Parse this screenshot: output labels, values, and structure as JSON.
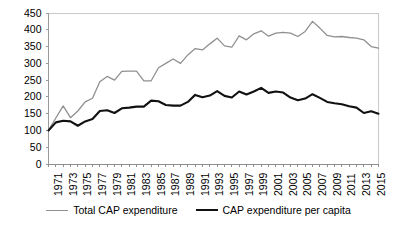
{
  "chart_data": {
    "type": "line",
    "title": "",
    "subtitle": "",
    "xlabel": "",
    "ylabel": "",
    "xlim": [
      1971,
      2016
    ],
    "ylim": [
      0,
      450
    ],
    "grid": false,
    "legend_position": "bottom",
    "yticks": [
      0,
      50,
      100,
      150,
      200,
      250,
      300,
      350,
      400,
      450
    ],
    "xticks": [
      1971,
      1973,
      1975,
      1977,
      1979,
      1981,
      1983,
      1985,
      1987,
      1989,
      1991,
      1993,
      1995,
      1997,
      1999,
      2001,
      2003,
      2005,
      2007,
      2009,
      2011,
      2013,
      2015
    ],
    "x": [
      1971,
      1972,
      1973,
      1974,
      1975,
      1976,
      1977,
      1978,
      1979,
      1980,
      1981,
      1982,
      1983,
      1984,
      1985,
      1986,
      1987,
      1988,
      1989,
      1990,
      1991,
      1992,
      1993,
      1994,
      1995,
      1996,
      1997,
      1998,
      1999,
      2000,
      2001,
      2002,
      2003,
      2004,
      2005,
      2006,
      2007,
      2008,
      2009,
      2010,
      2011,
      2012,
      2013,
      2014,
      2015,
      2016
    ],
    "series": [
      {
        "name": "Total CAP expenditure",
        "color": "#909090",
        "width": 1.3,
        "values": [
          100,
          137,
          173,
          138,
          158,
          185,
          196,
          245,
          261,
          250,
          276,
          277,
          277,
          248,
          248,
          287,
          300,
          313,
          300,
          325,
          344,
          340,
          358,
          375,
          352,
          348,
          382,
          370,
          388,
          397,
          381,
          390,
          392,
          390,
          380,
          395,
          425,
          405,
          383,
          379,
          380,
          377,
          375,
          370,
          350,
          345
        ]
      },
      {
        "name": "CAP expenditure per capita",
        "color": "#111111",
        "width": 2.1,
        "values": [
          100,
          124,
          129,
          127,
          114,
          127,
          134,
          158,
          160,
          152,
          166,
          168,
          171,
          171,
          189,
          187,
          176,
          174,
          174,
          185,
          206,
          199,
          204,
          217,
          203,
          198,
          216,
          207,
          216,
          227,
          212,
          216,
          213,
          198,
          190,
          195,
          208,
          197,
          185,
          181,
          178,
          172,
          168,
          152,
          157,
          150
        ]
      }
    ]
  },
  "legend": {
    "entries": [
      {
        "label": "Total CAP expenditure"
      },
      {
        "label": "CAP expenditure per capita"
      }
    ]
  }
}
